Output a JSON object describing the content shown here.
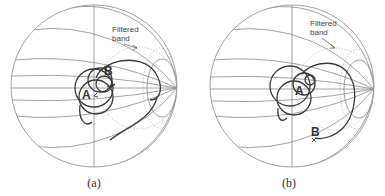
{
  "figure": {
    "panels": [
      {
        "id": "a",
        "caption": "(a)",
        "annotation": {
          "line1": "Filtered",
          "line2": "band"
        },
        "markers": [
          {
            "label": "A"
          },
          {
            "label": "B"
          }
        ]
      },
      {
        "id": "b",
        "caption": "(b)",
        "annotation": {
          "line1": "Filtered",
          "line2": "band"
        },
        "markers": [
          {
            "label": "A"
          },
          {
            "label": "B"
          }
        ]
      }
    ],
    "chart_type": "Smith chart",
    "colors": {
      "grid": "#8a8a8a",
      "trace": "#3a3a3a",
      "filtered_band": "#b5b5b5"
    }
  }
}
